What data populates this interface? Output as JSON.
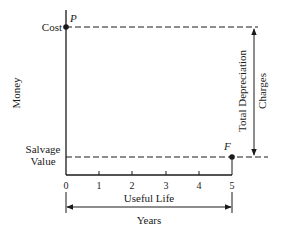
{
  "diagram": {
    "type": "straight-line-depreciation",
    "y_axis_label": "Money",
    "x_axis_ticks": [
      "0",
      "1",
      "2",
      "3",
      "4",
      "5"
    ],
    "points": {
      "start": {
        "label": "P",
        "level_label": "Cost"
      },
      "end": {
        "label": "F",
        "level_label_line1": "Salvage",
        "level_label_line2": "Value"
      }
    },
    "depreciation_arrow": {
      "label_line1": "Total Depreciation",
      "label_line2": "Charges"
    },
    "useful_life_arrow": {
      "label": "Useful Life",
      "units": "Years"
    }
  },
  "colors": {
    "ink": "#1a1a1a",
    "background": "#ffffff"
  }
}
